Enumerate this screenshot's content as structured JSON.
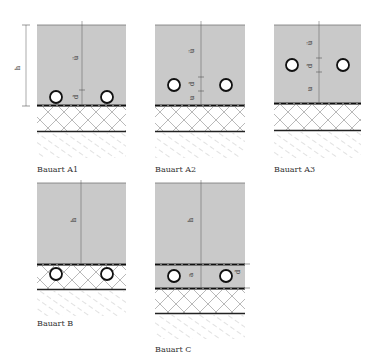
{
  "figure": {
    "colors": {
      "screed": "#c9c9c9",
      "line": "#333333",
      "hatch": "#9a9a9a",
      "pipe_fill": "#ffffff",
      "pipe_stroke": "#111111",
      "background": "#ffffff"
    },
    "panels": [
      {
        "id": "A1",
        "label": "Bauart A1",
        "dimensions": [
          "h",
          "ü",
          "d"
        ],
        "description": "Pipes resting on insulation at bottom of screed"
      },
      {
        "id": "A2",
        "label": "Bauart A2",
        "dimensions": [
          "ü",
          "d",
          "u"
        ],
        "description": "Pipes raised within screed, distance u below"
      },
      {
        "id": "A3",
        "label": "Bauart A3",
        "dimensions": [
          "ü",
          "d",
          "u"
        ],
        "description": "Pipes in middle of screed"
      },
      {
        "id": "B",
        "label": "Bauart B",
        "dimensions": [
          "h"
        ],
        "description": "Pipes embedded in insulation layer below screed"
      },
      {
        "id": "C",
        "label": "Bauart C",
        "dimensions": [
          "h",
          "a",
          "d"
        ],
        "description": "Pipes in separate leveling layer beneath screed"
      }
    ],
    "dim_labels": {
      "h": "h",
      "ue": "ü",
      "d": "d",
      "u": "u",
      "a": "a"
    }
  }
}
